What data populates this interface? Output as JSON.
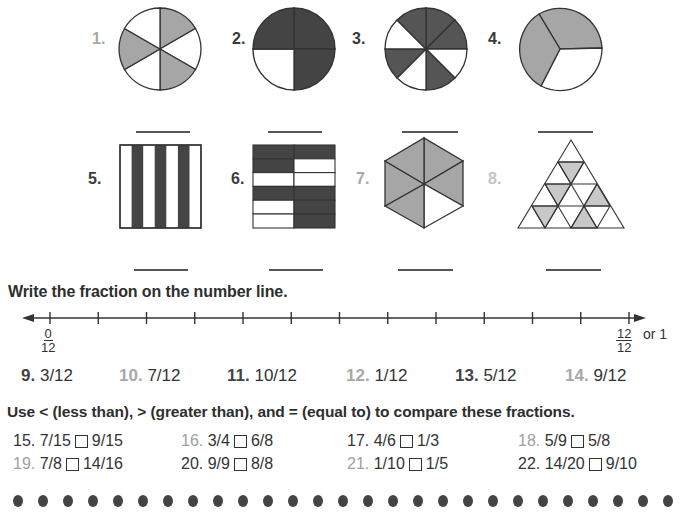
{
  "shapes": [
    {
      "label": "1.",
      "type": "circle",
      "parts": 6,
      "shaded": 3,
      "shade_color": "#a6a6a6",
      "label_style": "light"
    },
    {
      "label": "2.",
      "type": "circle",
      "parts": 4,
      "shaded": 3,
      "shade_color": "#444444",
      "label_style": "dark"
    },
    {
      "label": "3.",
      "type": "circle",
      "parts": 8,
      "shaded": 5,
      "shade_color": "#555555",
      "label_style": "dark"
    },
    {
      "label": "4.",
      "type": "circle",
      "parts": 3,
      "shaded": 2,
      "shade_color": "#a6a6a6",
      "label_style": "dark"
    },
    {
      "label": "5.",
      "type": "vertical-stripes",
      "parts": 7,
      "shaded": 3,
      "shade_color": "#444444",
      "label_style": "dark"
    },
    {
      "label": "6.",
      "type": "grid-rectangles",
      "parts": 12,
      "shaded": 7,
      "shade_color": "#444444",
      "label_style": "dark"
    },
    {
      "label": "7.",
      "type": "hexagon",
      "parts": 6,
      "shaded": 5,
      "shade_color": "#a6a6a6",
      "label_style": "light"
    },
    {
      "label": "8.",
      "type": "triangle-grid",
      "parts": 16,
      "shaded": 5,
      "shade_color": "#c8c8c8",
      "label_style": "light"
    }
  ],
  "number_line": {
    "heading": "Write the fraction on the number line.",
    "start": {
      "numerator": "0",
      "denominator": "12"
    },
    "end": {
      "numerator": "12",
      "denominator": "12",
      "suffix": "or 1"
    },
    "ticks": 13
  },
  "fraction_items": [
    {
      "num": "9.",
      "value": "3/12",
      "style": "dark"
    },
    {
      "num": "10.",
      "value": "7/12",
      "style": "light"
    },
    {
      "num": "11.",
      "value": "10/12",
      "style": "dark"
    },
    {
      "num": "12.",
      "value": "1/12",
      "style": "light"
    },
    {
      "num": "13.",
      "value": "5/12",
      "style": "dark"
    },
    {
      "num": "14.",
      "value": "9/12",
      "style": "light"
    }
  ],
  "compare": {
    "heading": "Use < (less than), > (greater than), and = (equal to) to compare these fractions.",
    "items": [
      {
        "num": "15.",
        "left": "7/15",
        "right": "9/15",
        "style": "dark"
      },
      {
        "num": "16.",
        "left": "3/4",
        "right": "6/8",
        "style": "light"
      },
      {
        "num": "17.",
        "left": "4/6",
        "right": "1/3",
        "style": "dark"
      },
      {
        "num": "18.",
        "left": "5/9",
        "right": "5/8",
        "style": "light"
      },
      {
        "num": "19.",
        "left": "7/8",
        "right": "14/16",
        "style": "light"
      },
      {
        "num": "20.",
        "left": "9/9",
        "right": "8/8",
        "style": "dark"
      },
      {
        "num": "21.",
        "left": "1/10",
        "right": "1/5",
        "style": "light"
      },
      {
        "num": "22.",
        "left": "14/20",
        "right": "9/10",
        "style": "dark"
      }
    ]
  },
  "footer": {
    "dot_count": 27,
    "dot_color": "#444444"
  }
}
